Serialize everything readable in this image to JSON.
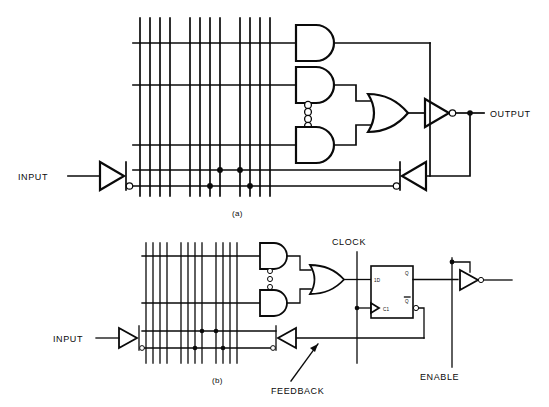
{
  "figure": {
    "title_a": "(a)",
    "title_b": "(b)"
  },
  "panel_a": {
    "name": "combinational-pal-array",
    "labels": {
      "input": "INPUT",
      "output": "OUTPUT"
    },
    "gates": {
      "and_gate_top": "AND",
      "and_gate_mid": "AND",
      "and_gate_bottom": "AND",
      "or_gate": "OR",
      "output_inverter": "INVERTER",
      "input_buffer": "BUFFER",
      "feedback_buffer": "BUFFER"
    },
    "vertical_lines": 12,
    "product_term_lines": 3,
    "vertical_dots": "⋮"
  },
  "panel_b": {
    "name": "registered-pal-array",
    "labels": {
      "input": "INPUT",
      "clock": "CLOCK",
      "feedback": "FEEDBACK",
      "enable": "ENABLE"
    },
    "flipflop": {
      "data_input": "1D",
      "clock_input": "C1",
      "q_output": "Q",
      "qbar_output": "Q"
    },
    "gates": {
      "and_gate_top": "AND",
      "and_gate_bottom": "AND",
      "or_gate": "OR",
      "output_inverter": "INVERTER",
      "input_buffer": "BUFFER",
      "feedback_buffer": "BUFFER"
    },
    "vertical_lines": 12,
    "product_term_lines": 2,
    "vertical_dots": "⋮"
  },
  "colors": {
    "ink": "#0a0a0a",
    "paper": "#ffffff"
  }
}
